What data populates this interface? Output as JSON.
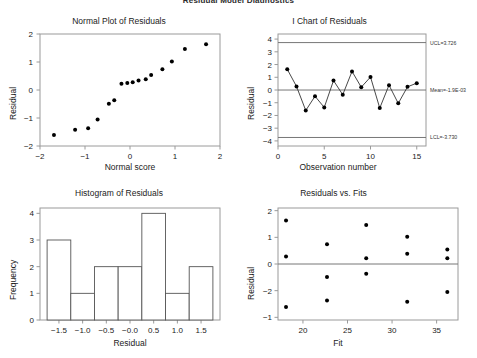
{
  "figure": {
    "suptitle": "Residual Model Diagnostics",
    "background": "#ffffff",
    "point_color": "#000000",
    "line_color": "#333333",
    "limit_line_color": "#777777",
    "axis_color": "#9a9a9a"
  },
  "panels": {
    "normal_plot": {
      "title": "Normal Plot of Residuals",
      "xlabel": "Normal score",
      "ylabel": "Residual",
      "xticks": [
        "-2",
        "-1",
        "0",
        "1",
        "2"
      ],
      "yticks": [
        "2",
        "1",
        "0",
        "-1",
        "-2"
      ]
    },
    "i_chart": {
      "title": "I Chart of Residuals",
      "xlabel": "Observation number",
      "ylabel": "Residual",
      "xticks": [
        "0",
        "5",
        "10",
        "15"
      ],
      "yticks": [
        "4",
        "3",
        "2",
        "1",
        "0",
        "-1",
        "-2",
        "-3",
        "-4"
      ],
      "ucl_label": "UCL=3.726",
      "mean_label": "Mean=-1.9E-03",
      "lcl_label": "LCL=-3.730"
    },
    "histogram": {
      "title": "Histogram of Residuals",
      "xlabel": "Residual",
      "ylabel": "Frequency",
      "xticks": [
        "-1.5",
        "-1.0",
        "-0.5",
        "-0.0",
        "0.5",
        "1.0",
        "1.5"
      ],
      "yticks": [
        "4",
        "3",
        "2",
        "1",
        "0"
      ]
    },
    "resid_vs_fits": {
      "title": "Residuals vs. Fits",
      "xlabel": "Fit",
      "ylabel": "Residual",
      "xticks": [
        "20",
        "25",
        "30",
        "35"
      ],
      "yticks": [
        "2",
        "1",
        "0",
        "-2",
        "-1"
      ]
    }
  },
  "chart_data": [
    {
      "type": "scatter",
      "id": "normal-plot-of-residuals",
      "title": "Normal Plot of Residuals",
      "xlabel": "Normal score",
      "ylabel": "Residual",
      "xlim": [
        -2.0,
        2.0
      ],
      "ylim": [
        -2.0,
        2.0
      ],
      "xticks": [
        -2,
        -1,
        0,
        1,
        2
      ],
      "yticks": [
        -2,
        -1,
        0,
        1,
        2
      ],
      "grid": false,
      "legend": false,
      "x": [
        -1.69,
        -1.22,
        -0.93,
        -0.72,
        -0.47,
        -0.35,
        -0.19,
        -0.06,
        0.06,
        0.19,
        0.35,
        0.47,
        0.72,
        0.93,
        1.22,
        1.69
      ],
      "y": [
        -1.61,
        -1.42,
        -1.37,
        -1.05,
        -0.49,
        -0.37,
        0.22,
        0.25,
        0.28,
        0.34,
        0.38,
        0.54,
        0.74,
        1.02,
        1.46,
        1.63
      ]
    },
    {
      "type": "line",
      "id": "i-chart-of-residuals",
      "title": "I Chart of Residuals",
      "xlabel": "Observation number",
      "ylabel": "Residual",
      "xlim": [
        0,
        16
      ],
      "ylim": [
        -4.4,
        4.4
      ],
      "xticks": [
        0,
        5,
        10,
        15
      ],
      "yticks": [
        -4,
        -3,
        -2,
        -1,
        0,
        1,
        2,
        3,
        4
      ],
      "grid": false,
      "legend": false,
      "markers": true,
      "x": [
        1,
        2,
        3,
        4,
        5,
        6,
        7,
        8,
        9,
        10,
        11,
        12,
        13,
        14,
        15
      ],
      "y": [
        1.63,
        0.28,
        -1.61,
        -0.49,
        -1.37,
        0.74,
        -0.37,
        1.46,
        0.22,
        1.02,
        -1.42,
        0.38,
        -1.05,
        0.25,
        0.54
      ],
      "annotations": [
        {
          "name": "ucl",
          "label": "UCL=3.726",
          "value": 3.726
        },
        {
          "name": "center",
          "label": "Mean=-1.9E-03",
          "value": -0.0019
        },
        {
          "name": "lcl",
          "label": "LCL=-3.730",
          "value": -3.73
        }
      ]
    },
    {
      "type": "bar",
      "id": "histogram-of-residuals",
      "title": "Histogram of Residuals",
      "xlabel": "Residual",
      "ylabel": "Frequency",
      "xlim": [
        -1.9,
        1.9
      ],
      "ylim": [
        0,
        4.2
      ],
      "xticks": [
        -1.5,
        -1.0,
        -0.5,
        -0.0,
        0.5,
        1.0,
        1.5
      ],
      "yticks": [
        0,
        1,
        2,
        3,
        4
      ],
      "grid": false,
      "legend": false,
      "bin_edges": [
        -1.75,
        -1.25,
        -0.75,
        -0.25,
        0.25,
        0.75,
        1.25,
        1.75
      ],
      "categories": [
        "-1.75..-1.25",
        "-1.25..-0.75",
        "-0.75..-0.25",
        "-0.25..0.25",
        "0.25..0.75",
        "0.75..1.25",
        "1.25..1.75"
      ],
      "values": [
        3,
        1,
        2,
        2,
        4,
        1,
        2
      ]
    },
    {
      "type": "scatter",
      "id": "residuals-vs-fits",
      "title": "Residuals vs. Fits",
      "xlabel": "Fit",
      "ylabel": "Residual",
      "xlim": [
        17.2,
        37.4
      ],
      "ylim": [
        -2.1,
        2.1
      ],
      "xticks": [
        20,
        25,
        30,
        35
      ],
      "yticks": [
        -2,
        -1,
        0,
        1,
        2
      ],
      "grid": false,
      "legend": false,
      "reference_line_y": 0,
      "x": [
        18.1,
        18.1,
        18.1,
        22.7,
        22.7,
        22.7,
        27.1,
        27.1,
        27.1,
        31.7,
        31.7,
        31.7,
        36.2,
        36.2,
        36.2
      ],
      "y": [
        1.63,
        0.28,
        -1.61,
        0.74,
        -0.49,
        -1.37,
        1.46,
        0.22,
        -0.37,
        1.02,
        0.38,
        -1.42,
        0.54,
        0.22,
        -1.05
      ]
    }
  ]
}
